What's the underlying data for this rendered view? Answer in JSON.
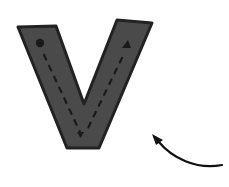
{
  "figure": {
    "letter": "V",
    "colors": {
      "background": "#ffffff",
      "fill": "#4a4a4a",
      "outline": "#222222",
      "markers": "#1a1a1a",
      "arrow": "#111111"
    },
    "markers": {
      "start": "circle",
      "top_right": "triangle",
      "bottom": "triangle"
    },
    "arrow": {
      "direction": "up-left",
      "style": "curved"
    }
  }
}
